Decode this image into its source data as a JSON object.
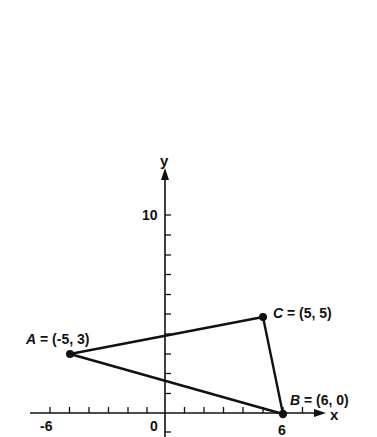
{
  "diagram": {
    "type": "coordinate-plane-triangle",
    "axes": {
      "x_label": "x",
      "y_label": "y",
      "x_tick_labels": [
        {
          "value": -6,
          "text": "-6"
        },
        {
          "value": 0,
          "text": "0"
        },
        {
          "value": 6,
          "text": "6"
        }
      ],
      "y_tick_labels": [
        {
          "value": 10,
          "text": "10"
        }
      ],
      "x_ticks": [
        -6,
        -5,
        -4,
        -3,
        -2,
        -1,
        1,
        2,
        3,
        4,
        5,
        6,
        7
      ],
      "y_ticks": [
        -1,
        1,
        2,
        3,
        4,
        5,
        6,
        7,
        8,
        9,
        10
      ]
    },
    "points": [
      {
        "name": "A",
        "x": -5,
        "y": 3,
        "label": "A = (-5, 3)",
        "letter": "A",
        "coords": " = (-5, 3)"
      },
      {
        "name": "B",
        "x": 6,
        "y": 0,
        "label": "B = (6, 0)",
        "letter": "B",
        "coords": " = (6, 0)"
      },
      {
        "name": "C",
        "x": 5,
        "y": 5,
        "label": "C = (5, 5)",
        "letter": "C",
        "coords": " = (5, 5)"
      }
    ],
    "edges": [
      [
        "A",
        "C"
      ],
      [
        "C",
        "B"
      ],
      [
        "B",
        "A"
      ]
    ],
    "colors": {
      "ink": "#111111",
      "background": "#ffffff"
    }
  }
}
